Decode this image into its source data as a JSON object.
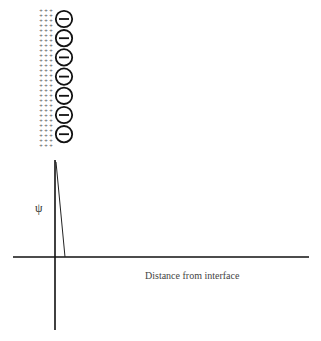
{
  "diagram": {
    "surface": {
      "charge_count": 7,
      "charge_symbol": "minus",
      "counterion_symbol": "+",
      "counterion_columns": 3
    },
    "plot": {
      "y_label": "ψ",
      "x_label": "Distance from interface",
      "curve": "linear potential drop from surface to zero near the interface"
    },
    "colors": {
      "line": "#111111",
      "background": "#ffffff"
    }
  }
}
